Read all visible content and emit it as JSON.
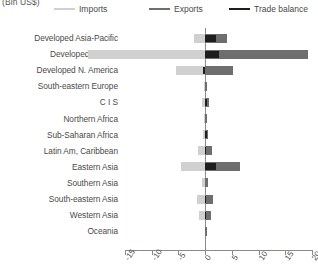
{
  "unit_label": "(Bln US$)",
  "legend": [
    {
      "name": "imports",
      "label": "Imports",
      "color": "#d0d0d0"
    },
    {
      "name": "exports",
      "label": "Exports",
      "color": "#6e6e6e"
    },
    {
      "name": "trade-balance",
      "label": "Trade balance",
      "color": "#1e1e1e"
    }
  ],
  "chart_data": {
    "type": "bar",
    "orientation": "horizontal",
    "title": "",
    "subtitle": "",
    "xlabel": "(Bln US$)",
    "ylabel": "",
    "xlim": [
      -15,
      20
    ],
    "xticks": [
      -15,
      -10,
      -5,
      0,
      5,
      10,
      15,
      20
    ],
    "xticklabels": [
      "-15",
      "-10",
      "-5",
      "0",
      "5",
      "10",
      "15",
      "20"
    ],
    "grid": false,
    "legend_position": "top",
    "categories": [
      "Developed Asia-Pacific",
      "Developed Europe",
      "Developed N. America",
      "South-eastern Europe",
      "C I S",
      "Northern Africa",
      "Sub-Saharan Africa",
      "Latin Am, Caribbean",
      "Eastern Asia",
      "Southern Asia",
      "South-eastern Asia",
      "Western Asia",
      "Oceania"
    ],
    "series": [
      {
        "name": "Imports",
        "color": "#d0d0d0",
        "values": [
          -2.0,
          -22.0,
          -5.5,
          -0.2,
          -0.6,
          -0.3,
          -0.4,
          -1.3,
          -4.6,
          -0.5,
          -1.6,
          -1.2,
          -0.1
        ]
      },
      {
        "name": "Exports",
        "color": "#6e6e6e",
        "values": [
          4.0,
          19.2,
          5.2,
          0.2,
          0.7,
          0.3,
          0.5,
          1.2,
          6.6,
          0.5,
          1.5,
          1.1,
          0.1
        ]
      },
      {
        "name": "Trade balance",
        "color": "#1e1e1e",
        "values": [
          2.0,
          2.6,
          -0.4,
          0.0,
          0.2,
          0.0,
          0.1,
          -0.1,
          2.0,
          0.0,
          -0.1,
          -0.1,
          0.0
        ]
      }
    ]
  }
}
